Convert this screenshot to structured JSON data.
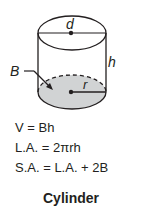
{
  "diagram": {
    "shape": "cylinder",
    "labels": {
      "diameter": "d",
      "height": "h",
      "base": "B",
      "radius": "r"
    },
    "colors": {
      "stroke": "#231f20",
      "base_fill": "#d1d3d4",
      "background": "#ffffff"
    }
  },
  "formulas": [
    {
      "id": "volume",
      "text": "V = Bh"
    },
    {
      "id": "lateral_area",
      "text": "L.A. = 2πrh"
    },
    {
      "id": "surface_area",
      "text": "S.A. = L.A. + 2B"
    }
  ],
  "caption": "Cylinder"
}
